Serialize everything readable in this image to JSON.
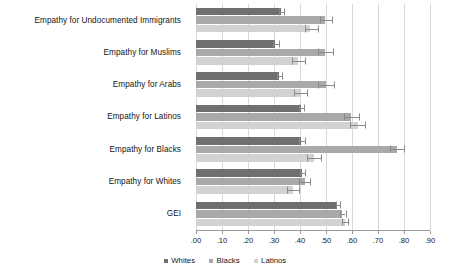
{
  "chart_data": {
    "type": "bar",
    "orientation": "horizontal",
    "title": "",
    "xlabel": "",
    "ylabel": "",
    "xlim": [
      0.0,
      0.9
    ],
    "grid": true,
    "legend_position": "bottom",
    "xticks": [
      ".00",
      ".10",
      ".20",
      ".30",
      ".40",
      ".50",
      ".60",
      ".70",
      ".80",
      ".90"
    ],
    "xtick_values": [
      0.0,
      0.1,
      0.2,
      0.3,
      0.4,
      0.5,
      0.6,
      0.7,
      0.8,
      0.9
    ],
    "categories": [
      "Empathy for Undocumented Immigrants",
      "Empathy for Muslims",
      "Empathy for Arabs",
      "Empathy for Latinos",
      "Empathy for Blacks",
      "Empathy for Whites",
      "GEI"
    ],
    "series": [
      {
        "name": "Whites",
        "color": "#6f6f6f",
        "values": [
          0.325,
          0.305,
          0.318,
          0.402,
          0.405,
          0.408,
          0.543
        ],
        "err_low": [
          0.318,
          0.298,
          0.311,
          0.395,
          0.398,
          0.4,
          0.538
        ],
        "err_high": [
          0.338,
          0.318,
          0.331,
          0.415,
          0.418,
          0.42,
          0.552
        ]
      },
      {
        "name": "Blacks",
        "color": "#a9a9a9",
        "values": [
          0.498,
          0.498,
          0.5,
          0.598,
          0.772,
          0.418,
          0.562
        ],
        "err_low": [
          0.478,
          0.47,
          0.47,
          0.57,
          0.745,
          0.398,
          0.552
        ],
        "err_high": [
          0.522,
          0.528,
          0.53,
          0.628,
          0.8,
          0.44,
          0.575
        ]
      },
      {
        "name": "Latinos",
        "color": "#d2d2d2",
        "values": [
          0.44,
          0.392,
          0.402,
          0.622,
          0.452,
          0.372,
          0.572
        ],
        "err_low": [
          0.418,
          0.368,
          0.378,
          0.592,
          0.425,
          0.35,
          0.562
        ],
        "err_high": [
          0.468,
          0.418,
          0.428,
          0.65,
          0.482,
          0.398,
          0.585
        ]
      }
    ]
  },
  "legend": {
    "items": [
      {
        "label": "Whites",
        "color": "#6f6f6f"
      },
      {
        "label": "Blacks",
        "color": "#a9a9a9"
      },
      {
        "label": "Latinos",
        "color": "#d2d2d2"
      }
    ]
  }
}
